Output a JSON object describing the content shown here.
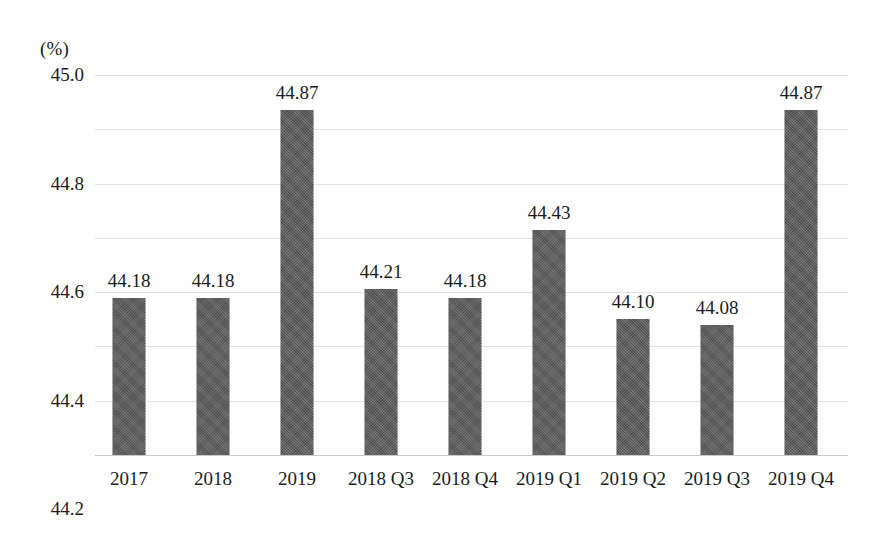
{
  "axis": {
    "unit_label": "(%)",
    "y_ticks": [
      "45.0",
      "44.8",
      "44.6",
      "44.4",
      "44.2",
      "44.0",
      "43.8",
      "43.6"
    ]
  },
  "colors": {
    "bar": "#5c5c5c",
    "gridline": "#e2e2e6",
    "baseline": "#c9c9cd",
    "text": "#1c1c1c",
    "background": "#fefefe"
  },
  "chart_data": {
    "type": "bar",
    "title": "",
    "xlabel": "",
    "ylabel": "(%)",
    "ylim": [
      43.6,
      45.0
    ],
    "ytick_step": 0.2,
    "grid": true,
    "legend": false,
    "categories": [
      "2017",
      "2018",
      "2019",
      "2018 Q3",
      "2018 Q4",
      "2019 Q1",
      "2019 Q2",
      "2019 Q3",
      "2019 Q4"
    ],
    "values": [
      44.18,
      44.18,
      44.87,
      44.21,
      44.18,
      44.43,
      44.1,
      44.08,
      44.87
    ],
    "data_labels": [
      "44.18",
      "44.18",
      "44.87",
      "44.21",
      "44.18",
      "44.43",
      "44.10",
      "44.08",
      "44.87"
    ]
  }
}
